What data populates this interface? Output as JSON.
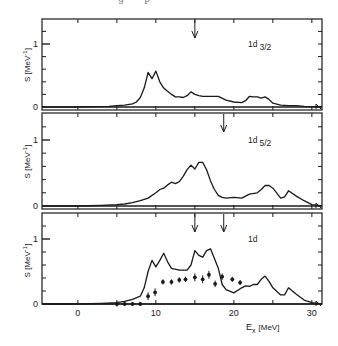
{
  "caption_fragment": "· · · g · · p · · · · · · ·",
  "chart_data": [
    {
      "type": "line",
      "panel": "top",
      "label": "1d 3/2",
      "label_main": "1d",
      "label_sub": "3/2",
      "ylabel": "S [MeV⁻¹]",
      "ylabel_main": "S",
      "ylabel_unit": "[MeV",
      "ylabel_exp": "-1",
      "ylabel_close": "]",
      "xlabel": "",
      "xlim": [
        -4.6,
        31.3
      ],
      "ylim": [
        0,
        1.4
      ],
      "yticks": [
        0,
        1
      ],
      "ytick_labels": [
        "0",
        "1"
      ],
      "arrows_at_MeV": [
        15
      ],
      "series": [
        {
          "name": "calculated strength 1d3/2",
          "x": [
            -4.6,
            0,
            2,
            4,
            5,
            6,
            7,
            7.5,
            8,
            8.5,
            9,
            9.5,
            10,
            10.5,
            11,
            11.5,
            12,
            12.5,
            13,
            13.5,
            14,
            14.5,
            15,
            15.5,
            16,
            17,
            18,
            19,
            20,
            21,
            21.5,
            22,
            22.5,
            23,
            23.5,
            24,
            24.5,
            25,
            26,
            27,
            28,
            29,
            30,
            31.3
          ],
          "y": [
            0.0,
            0.0,
            0.005,
            0.01,
            0.02,
            0.03,
            0.05,
            0.08,
            0.15,
            0.3,
            0.55,
            0.45,
            0.57,
            0.4,
            0.3,
            0.25,
            0.2,
            0.16,
            0.16,
            0.15,
            0.18,
            0.24,
            0.2,
            0.18,
            0.17,
            0.17,
            0.17,
            0.11,
            0.08,
            0.07,
            0.1,
            0.17,
            0.16,
            0.16,
            0.14,
            0.16,
            0.12,
            0.06,
            0.03,
            0.02,
            0.02,
            0.01,
            0.005,
            0.0
          ]
        }
      ]
    },
    {
      "type": "line",
      "panel": "middle",
      "label": "1d 5/2",
      "label_main": "1d",
      "label_sub": "5/2",
      "ylabel": "S [MeV⁻¹]",
      "ylabel_main": "S",
      "ylabel_unit": "[MeV",
      "ylabel_exp": "-1",
      "ylabel_close": "]",
      "xlabel": "",
      "xlim": [
        -4.6,
        31.3
      ],
      "ylim": [
        0,
        1.4
      ],
      "yticks": [
        0,
        1
      ],
      "ytick_labels": [
        "0",
        "1"
      ],
      "arrows_at_MeV": [
        18.7
      ],
      "series": [
        {
          "name": "calculated strength 1d5/2",
          "x": [
            -4.6,
            0,
            3,
            5,
            6,
            7,
            8,
            9,
            10,
            10.5,
            11,
            11.5,
            12,
            12.5,
            13,
            13.5,
            14,
            14.5,
            15,
            15.5,
            16,
            16.5,
            17,
            17.5,
            18,
            18.5,
            19,
            20,
            21,
            22,
            23,
            23.5,
            24,
            24.5,
            25,
            26,
            26.5,
            27,
            28,
            29,
            30,
            31.3
          ],
          "y": [
            0.0,
            0.0,
            0.01,
            0.02,
            0.03,
            0.05,
            0.08,
            0.12,
            0.2,
            0.25,
            0.27,
            0.32,
            0.36,
            0.34,
            0.37,
            0.45,
            0.55,
            0.62,
            0.56,
            0.66,
            0.66,
            0.55,
            0.38,
            0.25,
            0.16,
            0.13,
            0.12,
            0.13,
            0.12,
            0.18,
            0.2,
            0.25,
            0.31,
            0.31,
            0.27,
            0.12,
            0.14,
            0.23,
            0.15,
            0.08,
            0.02,
            0.0
          ]
        }
      ]
    },
    {
      "type": "line",
      "panel": "bottom",
      "label": "1d",
      "label_main": "1d",
      "label_sub": "",
      "ylabel": "S [MeV⁻¹]",
      "ylabel_main": "S",
      "ylabel_unit": "[MeV",
      "ylabel_exp": "-1",
      "ylabel_close": "]",
      "xlabel": "E_x [MeV]",
      "xlabel_main": "E",
      "xlabel_sub": "x",
      "xlabel_unit": "[MeV]",
      "xlim": [
        -4.6,
        31.3
      ],
      "ylim": [
        0,
        1.4
      ],
      "xticks": [
        0,
        10,
        20,
        30
      ],
      "xtick_labels": [
        "0",
        "10",
        "20",
        "30"
      ],
      "yticks": [
        0,
        1
      ],
      "ytick_labels": [
        "0",
        "1"
      ],
      "arrows_at_MeV": [
        15,
        18.7
      ],
      "series": [
        {
          "name": "calculated total 1d strength",
          "x": [
            -4.6,
            0,
            3,
            5,
            6,
            7,
            8,
            8.5,
            9,
            9.5,
            10,
            10.5,
            11,
            11.5,
            12,
            13,
            14,
            14.5,
            15,
            15.5,
            16,
            16.5,
            17,
            17.5,
            18,
            18.5,
            19,
            20,
            21,
            21.5,
            22,
            22.5,
            23,
            23.5,
            24,
            24.5,
            25,
            26,
            26.5,
            27,
            28,
            29,
            30,
            31.3
          ],
          "y": [
            0.0,
            0.0,
            0.01,
            0.02,
            0.04,
            0.07,
            0.12,
            0.25,
            0.5,
            0.67,
            0.57,
            0.67,
            0.78,
            0.65,
            0.55,
            0.52,
            0.52,
            0.6,
            0.82,
            0.75,
            0.72,
            0.82,
            0.85,
            0.7,
            0.55,
            0.3,
            0.22,
            0.17,
            0.25,
            0.28,
            0.27,
            0.3,
            0.3,
            0.38,
            0.43,
            0.35,
            0.25,
            0.14,
            0.14,
            0.25,
            0.15,
            0.06,
            0.02,
            0.0
          ]
        },
        {
          "name": "experimental points (with error bars)",
          "type": "scatter",
          "x": [
            5,
            6,
            7,
            8,
            9,
            9.9,
            10.9,
            12,
            13,
            13.8,
            15,
            16,
            16.8,
            17.6,
            18.5,
            19.8,
            20.8
          ],
          "y": [
            0.0,
            0.0,
            0.0,
            0.0,
            0.12,
            0.18,
            0.34,
            0.34,
            0.37,
            0.38,
            0.41,
            0.38,
            0.45,
            0.31,
            0.42,
            0.38,
            0.33
          ],
          "err": [
            0.04,
            0.03,
            0.03,
            0.03,
            0.06,
            0.06,
            0.04,
            0.04,
            0.04,
            0.04,
            0.06,
            0.06,
            0.06,
            0.05,
            0.05,
            0.04,
            0.04
          ]
        }
      ]
    }
  ]
}
